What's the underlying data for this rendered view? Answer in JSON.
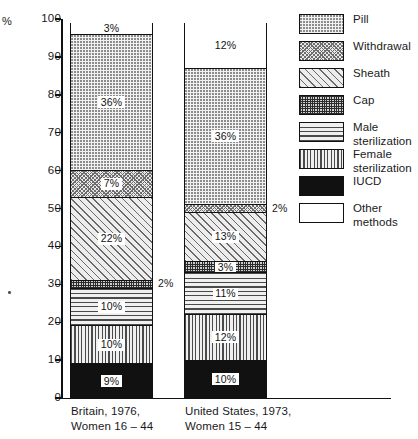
{
  "axis": {
    "unit_label": "%",
    "ticks": [
      0,
      10,
      20,
      30,
      40,
      50,
      60,
      70,
      80,
      90,
      100
    ],
    "min": 0,
    "max": 100
  },
  "legend": {
    "items": [
      {
        "label": "Pill",
        "pattern": "pat-pill",
        "name": "legend-swatch-pill"
      },
      {
        "label": "Withdrawal",
        "pattern": "pat-withdrawal",
        "name": "legend-swatch-withdrawal"
      },
      {
        "label": "Sheath",
        "pattern": "pat-sheath",
        "name": "legend-swatch-sheath"
      },
      {
        "label": "Cap",
        "pattern": "pat-cap",
        "name": "legend-swatch-cap"
      },
      {
        "label": "Male\nsterilization",
        "pattern": "pat-male",
        "name": "legend-swatch-male-sterilization"
      },
      {
        "label": "Female\nsterilization",
        "pattern": "pat-female",
        "name": "legend-swatch-female-sterilization"
      },
      {
        "label": "IUCD",
        "pattern": "pat-iucd",
        "name": "legend-swatch-iucd"
      },
      {
        "label": "Other\nmethods",
        "pattern": "pat-other",
        "name": "legend-swatch-other-methods"
      }
    ]
  },
  "bars": [
    {
      "name": "britain-bar",
      "x_label_line1": "Britain, 1976,",
      "x_label_line2": "Women 16 – 44",
      "segments": [
        {
          "category": "IUCD",
          "value": 9,
          "label": "9%",
          "pattern": "pat-iucd",
          "label_inside": true
        },
        {
          "category": "Female sterilization",
          "value": 10,
          "label": "10%",
          "pattern": "pat-female",
          "label_inside": true
        },
        {
          "category": "Male sterilization",
          "value": 10,
          "label": "10%",
          "pattern": "pat-male",
          "label_inside": true
        },
        {
          "category": "Cap",
          "value": 2,
          "label": "2%",
          "pattern": "pat-cap",
          "label_inside": false
        },
        {
          "category": "Sheath",
          "value": 22,
          "label": "22%",
          "pattern": "pat-sheath",
          "label_inside": true
        },
        {
          "category": "Withdrawal",
          "value": 7,
          "label": "7%",
          "pattern": "pat-withdrawal",
          "label_inside": true
        },
        {
          "category": "Pill",
          "value": 36,
          "label": "36%",
          "pattern": "pat-pill",
          "label_inside": true
        },
        {
          "category": "Other methods",
          "value": 3,
          "label": "3%",
          "pattern": "pat-other",
          "label_inside": true
        }
      ]
    },
    {
      "name": "united-states-bar",
      "x_label_line1": "United States, 1973,",
      "x_label_line2": "Women 15 – 44",
      "segments": [
        {
          "category": "IUCD",
          "value": 10,
          "label": "10%",
          "pattern": "pat-iucd",
          "label_inside": true
        },
        {
          "category": "Female sterilization",
          "value": 12,
          "label": "12%",
          "pattern": "pat-female",
          "label_inside": true
        },
        {
          "category": "Male sterilization",
          "value": 11,
          "label": "11%",
          "pattern": "pat-male",
          "label_inside": true
        },
        {
          "category": "Cap",
          "value": 3,
          "label": "3%",
          "pattern": "pat-cap",
          "label_inside": true
        },
        {
          "category": "Sheath",
          "value": 13,
          "label": "13%",
          "pattern": "pat-sheath",
          "label_inside": true
        },
        {
          "category": "Withdrawal",
          "value": 2,
          "label": "2%",
          "pattern": "pat-withdrawal",
          "label_inside": false
        },
        {
          "category": "Pill",
          "value": 36,
          "label": "36%",
          "pattern": "pat-pill",
          "label_inside": true
        },
        {
          "category": "Other methods",
          "value": 12,
          "label": "12%",
          "pattern": "pat-other",
          "label_inside": true
        }
      ]
    }
  ],
  "chart_data": {
    "type": "bar",
    "subtype": "stacked-bar-100-percent",
    "title": "",
    "xlabel": "",
    "ylabel": "%",
    "ylim": [
      0,
      100
    ],
    "yticks": [
      0,
      10,
      20,
      30,
      40,
      50,
      60,
      70,
      80,
      90,
      100
    ],
    "grid": false,
    "legend_position": "right",
    "categories": [
      "Britain, 1976, Women 16 – 44",
      "United States, 1973, Women 15 – 44"
    ],
    "series": [
      {
        "name": "IUCD",
        "values": [
          9,
          10
        ]
      },
      {
        "name": "Female sterilization",
        "values": [
          10,
          12
        ]
      },
      {
        "name": "Male sterilization",
        "values": [
          10,
          11
        ]
      },
      {
        "name": "Cap",
        "values": [
          2,
          3
        ]
      },
      {
        "name": "Sheath",
        "values": [
          22,
          13
        ]
      },
      {
        "name": "Withdrawal",
        "values": [
          7,
          2
        ]
      },
      {
        "name": "Pill",
        "values": [
          36,
          36
        ]
      },
      {
        "name": "Other methods",
        "values": [
          3,
          12
        ]
      }
    ],
    "annotations": [
      {
        "text": "2%",
        "refers_to": "Cap, Britain 1976",
        "placement": "right-of-bar"
      },
      {
        "text": "2%",
        "refers_to": "Withdrawal, United States 1973",
        "placement": "right-of-bar"
      }
    ]
  }
}
